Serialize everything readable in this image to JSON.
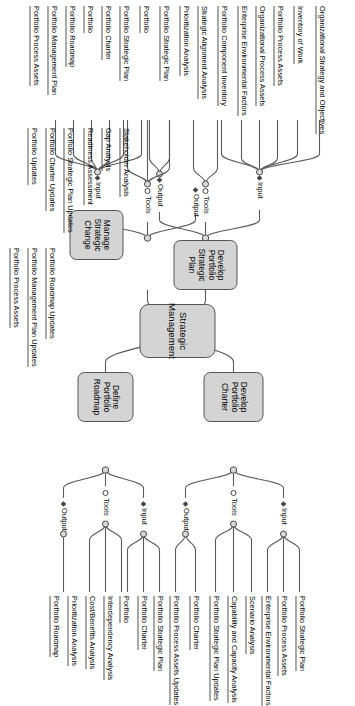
{
  "diagram": {
    "title": "Strategic Management",
    "type": "mind-map",
    "orientation": "rotated-90-clockwise",
    "markers": {
      "input": "diamond-marker",
      "tools": "dot-marker",
      "output": "diamond-marker"
    },
    "category_labels": {
      "input": "Input",
      "tools": "Tools",
      "output": "Output"
    },
    "center": {
      "label": "Strategic Management"
    },
    "branches": [
      {
        "id": "develop-portfolio-strategic-plan",
        "label": "Develop Portfolio Strategic Plan",
        "input": [
          "Organizational Strategy and Objectives",
          "Inventory of Work",
          "Portfolio Process Assets",
          "Organizational Process Assets",
          "Enterprise Environmental Factors",
          "Portfolio Component Inventory"
        ],
        "tools": [
          "Strategic Alignment Analysis",
          "Prioritization Analysis"
        ],
        "output": [
          "Portfolio Strategic Plan",
          "Portfolio"
        ]
      },
      {
        "id": "develop-portfolio-charter",
        "label": "Develop Portfolio Charter",
        "input": [
          "Portfolio Strategic Plan",
          "Portfolio Process Assets",
          "Enterprise Environmental Factors"
        ],
        "tools": [
          "Scenario Analysis",
          "Capability and Capacity Analysis",
          "Portfolio Strategic Plan Updates"
        ],
        "output": [
          "Portfolio Charter",
          "Portfolio Process Assets Updates"
        ]
      },
      {
        "id": "define-portfolio-roadmap",
        "label": "Define Portfolio Roadmap",
        "input": [
          "Portfolio Strategic Plan",
          "Portfolio Charter",
          "Portfolio"
        ],
        "tools": [
          "Interdependency Analysis",
          "Cost/Benefits Analysis",
          "Prioritization Analysis"
        ],
        "output": [
          "Portfolio Roadmap"
        ]
      },
      {
        "id": "manage-strategic-change",
        "label": "Manage Strategic Change",
        "input": [
          "Portfolio Strategic Plan",
          "Portfolio Charter",
          "Portfolio",
          "Portfolio Roadmap",
          "Portfolio Management Plan",
          "Portfolio Process Assets"
        ],
        "tools": [
          "Stakeholder Analysis",
          "Gap Analysis",
          "Readiness Assessment"
        ],
        "output": [
          "Portfolio Strategic Plan Updates",
          "Portfolio Charter Updates",
          "Portfolio Updates",
          "Portfolio Roadmap Updates",
          "Portfolio Management Plan Updates",
          "Portfolio Process Assets"
        ]
      }
    ]
  }
}
